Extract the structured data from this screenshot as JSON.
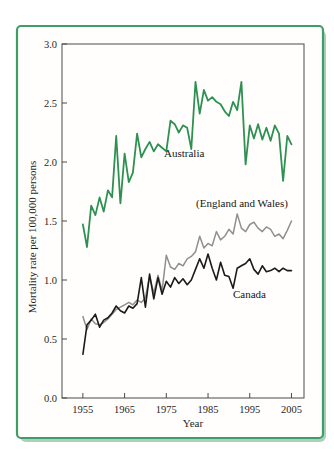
{
  "figure": {
    "frame_color": "#3f9e68",
    "frame_fill": "#fffefc",
    "shadow_color": "#aecfba",
    "axis_color": "#4a4a4a",
    "tick_text_color": "#1f1f1f"
  },
  "chart_data": {
    "type": "line",
    "title": "",
    "xlabel": "Year",
    "ylabel": "Mortality rate per 100,000 persons",
    "xlim": [
      1950,
      2008
    ],
    "ylim": [
      0.0,
      3.0
    ],
    "grid": false,
    "legend_position": "inline-annotations",
    "x_ticks": {
      "values": [
        1955,
        1965,
        1975,
        1985,
        1995,
        2005
      ],
      "labels": [
        "1955",
        "1965",
        "1975",
        "1985",
        "1995",
        "2005"
      ]
    },
    "y_ticks": {
      "values": [
        0.0,
        0.5,
        1.0,
        1.5,
        2.0,
        2.5,
        3.0
      ],
      "labels": [
        "0.0",
        "0.5",
        "1.0",
        "1.5",
        "2.0",
        "2.5",
        "3.0"
      ]
    },
    "years": [
      1955,
      1956,
      1957,
      1958,
      1959,
      1960,
      1961,
      1962,
      1963,
      1964,
      1965,
      1966,
      1967,
      1968,
      1969,
      1970,
      1971,
      1972,
      1973,
      1974,
      1975,
      1976,
      1977,
      1978,
      1979,
      1980,
      1981,
      1982,
      1983,
      1984,
      1985,
      1986,
      1987,
      1988,
      1989,
      1990,
      1991,
      1992,
      1993,
      1994,
      1995,
      1996,
      1997,
      1998,
      1999,
      2000,
      2001,
      2002,
      2003,
      2004,
      2005
    ],
    "series": [
      {
        "name": "Australia",
        "label": "Australia",
        "color": "#2e9152",
        "values": [
          1.47,
          1.28,
          1.63,
          1.55,
          1.7,
          1.58,
          1.76,
          1.7,
          2.22,
          1.65,
          2.07,
          1.83,
          1.91,
          2.24,
          2.04,
          2.11,
          2.17,
          2.09,
          2.15,
          2.12,
          2.09,
          2.35,
          2.32,
          2.25,
          2.31,
          2.29,
          2.11,
          2.68,
          2.41,
          2.61,
          2.52,
          2.55,
          2.51,
          2.49,
          2.43,
          2.39,
          2.51,
          2.44,
          2.68,
          1.98,
          2.31,
          2.2,
          2.32,
          2.19,
          2.29,
          2.18,
          2.31,
          2.24,
          1.84,
          2.22,
          2.15
        ]
      },
      {
        "name": "England and Wales",
        "label": "(England and Wales)",
        "color": "#8f8f8f",
        "values": [
          0.69,
          0.58,
          0.67,
          0.63,
          0.62,
          0.64,
          0.67,
          0.71,
          0.75,
          0.77,
          0.79,
          0.81,
          0.79,
          0.83,
          0.81,
          0.85,
          1.03,
          0.89,
          1.04,
          0.91,
          1.21,
          1.11,
          1.09,
          1.14,
          1.12,
          1.18,
          1.2,
          1.24,
          1.37,
          1.27,
          1.31,
          1.29,
          1.41,
          1.34,
          1.37,
          1.43,
          1.39,
          1.56,
          1.44,
          1.41,
          1.47,
          1.49,
          1.44,
          1.41,
          1.45,
          1.43,
          1.37,
          1.39,
          1.35,
          1.42,
          1.5
        ]
      },
      {
        "name": "Canada",
        "label": "Canada",
        "color": "#1b1b1b",
        "values": [
          0.37,
          0.62,
          0.66,
          0.71,
          0.6,
          0.66,
          0.68,
          0.72,
          0.78,
          0.74,
          0.72,
          0.78,
          0.76,
          0.8,
          1.02,
          0.77,
          1.05,
          0.84,
          1.02,
          0.88,
          0.99,
          0.94,
          1.02,
          0.97,
          1.01,
          0.96,
          1.0,
          1.09,
          1.18,
          1.1,
          1.22,
          1.1,
          1.0,
          1.15,
          1.04,
          1.03,
          0.93,
          1.1,
          1.12,
          1.14,
          1.18,
          1.09,
          1.05,
          1.12,
          1.07,
          1.08,
          1.1,
          1.07,
          1.1,
          1.08,
          1.08
        ]
      }
    ]
  }
}
